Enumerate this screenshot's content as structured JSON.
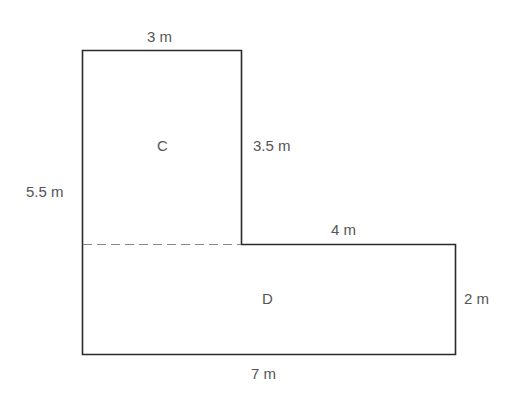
{
  "diagram": {
    "colors": {
      "outline": "#2a2a2a",
      "dashed": "#888888",
      "text": "#555555"
    },
    "regions": {
      "upper": "C",
      "lower": "D"
    },
    "dimensions": {
      "top_width": "3 m",
      "left_height": "5.5 m",
      "inner_vertical": "3.5 m",
      "inner_horizontal": "4 m",
      "right_height": "2 m",
      "bottom_width": "7 m"
    }
  }
}
